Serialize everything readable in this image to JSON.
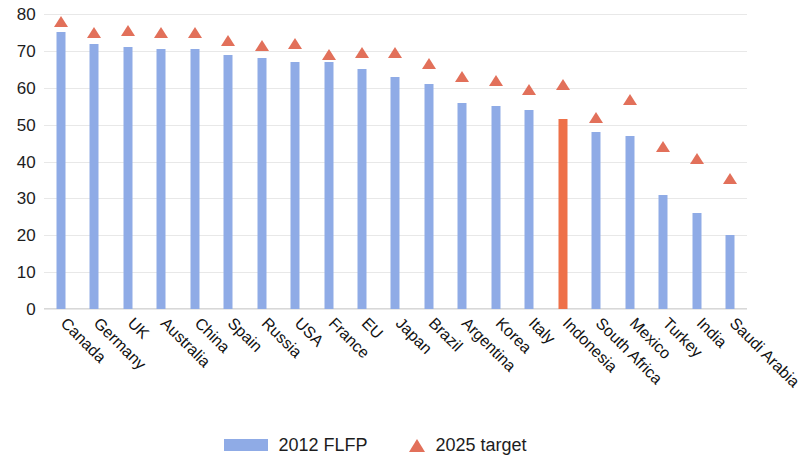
{
  "chart_data": {
    "type": "bar",
    "title": "",
    "subtitle": "",
    "xlabel": "",
    "ylabel": "",
    "ylim": [
      0,
      80
    ],
    "yticks": [
      0,
      10,
      20,
      30,
      40,
      50,
      60,
      70,
      80
    ],
    "grid": true,
    "legend_position": "bottom",
    "categories": [
      "Canada",
      "Germany",
      "UK",
      "Australia",
      "China",
      "Spain",
      "Russia",
      "USA",
      "France",
      "EU",
      "Japan",
      "Brazil",
      "Argentina",
      "Korea",
      "Italy",
      "Indonesia",
      "South Africa",
      "Mexico",
      "Turkey",
      "India",
      "Saudi Arabia"
    ],
    "series": [
      {
        "name": "2012 FLFP",
        "type": "bar",
        "color": "#8fabe6",
        "highlight_color": "#ee7048",
        "highlight_category": "Indonesia",
        "values": [
          75,
          72,
          71,
          70.5,
          70.5,
          69,
          68,
          67,
          67,
          65,
          63,
          61,
          56,
          55,
          54,
          51.5,
          48,
          47,
          31,
          26,
          20
        ]
      },
      {
        "name": "2025 target",
        "type": "scatter-marker",
        "marker": "triangle",
        "color": "#e2705a",
        "values": [
          77,
          74,
          74.5,
          74,
          74,
          72,
          70.5,
          71,
          68,
          68.5,
          68.5,
          65.5,
          62,
          61,
          58.5,
          60,
          51,
          56,
          43,
          40,
          34.5
        ]
      }
    ]
  },
  "axis": {
    "y_tick_labels": [
      "0",
      "10",
      "20",
      "30",
      "40",
      "50",
      "60",
      "70",
      "80"
    ]
  },
  "legend": {
    "items": [
      {
        "label": "2012 FLFP",
        "icon": "bar-swatch",
        "color": "#8fabe6"
      },
      {
        "label": "2025 target",
        "icon": "triangle-marker",
        "color": "#e2705a"
      }
    ]
  },
  "colors": {
    "bar_blue": "#8fabe6",
    "bar_orange": "#ee7048",
    "marker_red": "#e2705a",
    "gridline": "#e8e8e8",
    "text": "#1d1d1d",
    "background": "#ffffff"
  }
}
